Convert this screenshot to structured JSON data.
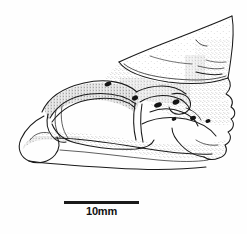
{
  "figure": {
    "kind": "scientific-line-drawing",
    "technique": "ink line drawing with stipple shading",
    "background_color": "#fefefe",
    "ink_color": "#1a1a1a",
    "stipple_color": "#5a5a5a"
  },
  "scalebar": {
    "label": "10mm",
    "length_px": 75,
    "represents_mm": 10,
    "line_color": "#1a1a1a",
    "x": 64,
    "y": 201
  },
  "anatomy": {
    "regions": [
      {
        "name": "dorsal-blade",
        "label": "dorsal blade / ascending process"
      },
      {
        "name": "orbital-fenestra",
        "label": "large orbital opening"
      },
      {
        "name": "zygomatic-arch",
        "label": "slender ventral bar"
      },
      {
        "name": "anterior-condyle",
        "label": "rounded anterior knob"
      },
      {
        "name": "posterior-margin",
        "label": "crenulate posterior margin"
      }
    ],
    "foramina": [
      {
        "name": "foramen-1",
        "cx": 108,
        "cy": 84,
        "rx": 3.4,
        "ry": 2.2,
        "rot": -20
      },
      {
        "name": "foramen-2",
        "cx": 135,
        "cy": 98,
        "rx": 3.2,
        "ry": 2.3,
        "rot": -30
      },
      {
        "name": "foramen-3",
        "cx": 158,
        "cy": 105,
        "rx": 4.0,
        "ry": 2.4,
        "rot": -18
      },
      {
        "name": "foramen-4",
        "cx": 176,
        "cy": 102,
        "rx": 3.6,
        "ry": 2.4,
        "rot": -25
      },
      {
        "name": "foramen-5",
        "cx": 193,
        "cy": 118,
        "rx": 3.0,
        "ry": 2.0,
        "rot": -15
      },
      {
        "name": "foramen-6",
        "cx": 208,
        "cy": 121,
        "rx": 2.6,
        "ry": 1.9,
        "rot": -10
      },
      {
        "name": "foramen-7",
        "cx": 174,
        "cy": 119,
        "rx": 2.4,
        "ry": 1.7,
        "rot": -20
      }
    ]
  }
}
